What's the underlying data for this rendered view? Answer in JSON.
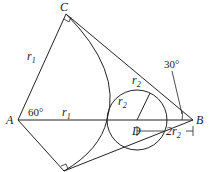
{
  "diagram": {
    "points": {
      "A": "A",
      "B": "B",
      "C": "C",
      "D": "D"
    },
    "labels": {
      "r1_left": "r",
      "r1_left_sub": "1",
      "r1_mid": "r",
      "r1_mid_sub": "1",
      "r2_a": "r",
      "r2_a_sub": "2",
      "r2_b": "r",
      "r2_b_sub": "2",
      "angle_A": "60°",
      "angle_B": "30°",
      "dist_prefix": "2r",
      "dist_sub": "2"
    },
    "colors": {
      "stroke": "#222222",
      "background": "#ffffff"
    }
  }
}
